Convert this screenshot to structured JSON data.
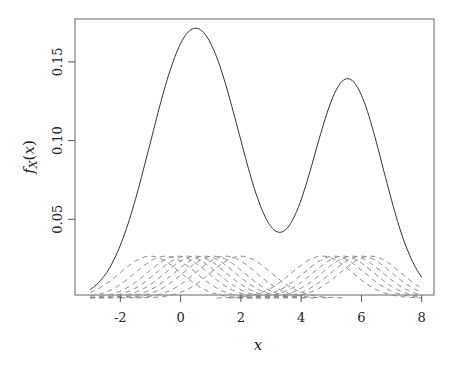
{
  "chart_data": {
    "type": "line",
    "title": "",
    "xlabel": "x",
    "ylabel": "f_X(x)",
    "xlim": [
      -3.5,
      8.5
    ],
    "ylim": [
      0.002,
      0.175
    ],
    "x_ticks": [
      -2,
      0,
      2,
      4,
      6,
      8
    ],
    "x_tick_labels": [
      "-2",
      "0",
      "2",
      "4",
      "6",
      "8"
    ],
    "y_ticks": [
      0.05,
      0.1,
      0.15
    ],
    "y_tick_labels": [
      "0.05",
      "0.10",
      "0.15"
    ],
    "grid": false,
    "legend": null,
    "curve_range": [
      -3,
      8
    ],
    "kernel": {
      "type": "gaussian",
      "sd": 1.0
    },
    "sample_points": [
      -1.0,
      -0.5,
      -0.1,
      0.2,
      0.5,
      0.8,
      1.1,
      1.5,
      2.0,
      4.7,
      5.1,
      5.4,
      5.7,
      6.0,
      6.3
    ],
    "series": [
      {
        "name": "density",
        "style": "solid",
        "color": "#333333",
        "key_points": [
          [
            -3,
            0.0095
          ],
          [
            0.48,
            0.17
          ],
          [
            3.39,
            0.0445
          ],
          [
            5.49,
            0.138
          ],
          [
            8,
            0.01
          ]
        ]
      },
      {
        "name": "individual kernels (scaled 1/n)",
        "style": "dashed",
        "color": "#888888",
        "peak_value": 0.0266
      }
    ]
  },
  "colors": {
    "main_line": "#333333",
    "kernel_line": "#8a8a8a",
    "axis": "#555555"
  }
}
